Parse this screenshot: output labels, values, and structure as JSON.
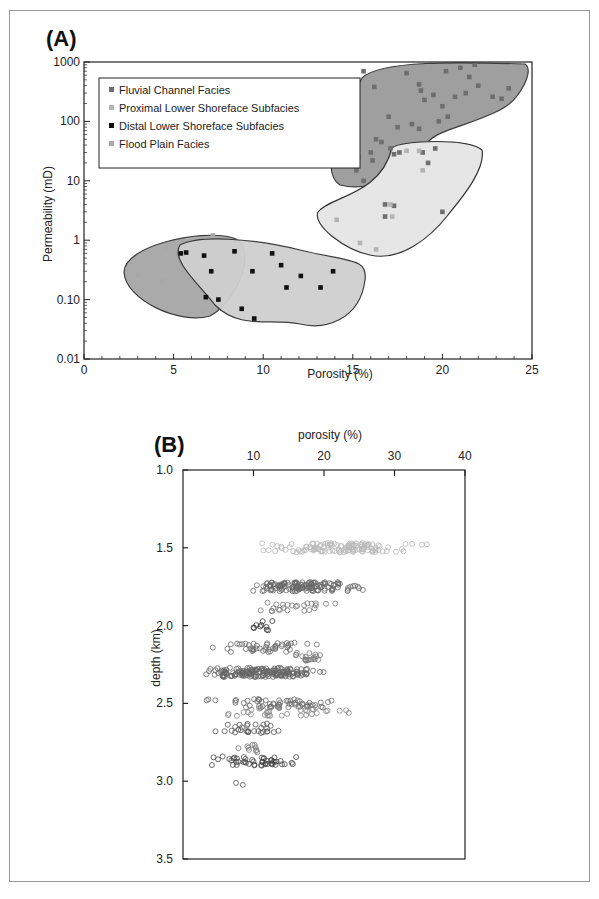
{
  "figure": {
    "panel_a_label": "(A)",
    "panel_b_label": "(B)"
  },
  "chart_data": [
    {
      "type": "scatter",
      "panel": "(A)",
      "title": "",
      "xlabel": "Porosity  (%)",
      "ylabel": "Permeability  (mD)",
      "xlim": [
        0,
        25
      ],
      "ylim": [
        0.01,
        1000
      ],
      "yscale": "log",
      "x_ticks": [
        "0",
        "5",
        "10",
        "15",
        "20",
        "25"
      ],
      "y_ticks": [
        "0.01",
        "0.10",
        "1",
        "10",
        "100",
        "1000"
      ],
      "grid": false,
      "legend_position": "upper-left",
      "legend": [
        {
          "name": "Fluvial Channel Facies",
          "color": "#6e6e6e"
        },
        {
          "name": "Proximal Lower Shoreface  Subfacies",
          "color": "#b4b4b4"
        },
        {
          "name": "Distal Lower Shoreface  Subfacies",
          "color": "#111111"
        },
        {
          "name": "Flood  Plain  Facies",
          "color": "#a8a8a8"
        }
      ],
      "series": [
        {
          "name": "Fluvial Channel Facies",
          "points": [
            [
              15.6,
              700
            ],
            [
              16.2,
              380
            ],
            [
              18.0,
              650
            ],
            [
              18.7,
              420
            ],
            [
              18.8,
              330
            ],
            [
              19.0,
              230
            ],
            [
              19.5,
              280
            ],
            [
              20.0,
              180
            ],
            [
              20.2,
              700
            ],
            [
              20.7,
              260
            ],
            [
              20.3,
              120
            ],
            [
              19.8,
              100
            ],
            [
              21.3,
              300
            ],
            [
              21.0,
              800
            ],
            [
              21.5,
              560
            ],
            [
              22.0,
              400
            ],
            [
              22.8,
              260
            ],
            [
              23.3,
              240
            ],
            [
              23.7,
              360
            ],
            [
              21.8,
              900
            ],
            [
              17.0,
              120
            ],
            [
              17.5,
              80
            ],
            [
              18.3,
              90
            ],
            [
              18.7,
              75
            ],
            [
              16.3,
              50
            ],
            [
              16.6,
              45
            ],
            [
              17.1,
              35
            ],
            [
              17.3,
              28
            ],
            [
              17.6,
              30
            ],
            [
              18.9,
              30
            ],
            [
              19.6,
              35
            ],
            [
              19.2,
              20
            ],
            [
              14.6,
              45
            ],
            [
              14.8,
              45
            ],
            [
              15.3,
              25
            ],
            [
              15.2,
              15
            ],
            [
              16.0,
              30
            ],
            [
              16.1,
              22
            ],
            [
              15.6,
              10
            ],
            [
              16.8,
              4
            ],
            [
              16.8,
              2.5
            ],
            [
              20.0,
              3
            ],
            [
              17.3,
              3.8
            ]
          ]
        },
        {
          "name": "Proximal Lower Shoreface  Subfacies",
          "points": [
            [
              18.0,
              32
            ],
            [
              18.7,
              32
            ],
            [
              18.9,
              15
            ],
            [
              17.1,
              4
            ],
            [
              17.2,
              2.5
            ],
            [
              14.1,
              2.2
            ],
            [
              15.4,
              0.9
            ],
            [
              16.3,
              0.7
            ]
          ]
        },
        {
          "name": "Distal Lower Shoreface  Subfacies",
          "points": [
            [
              5.4,
              0.6
            ],
            [
              5.7,
              0.62
            ],
            [
              6.7,
              0.55
            ],
            [
              7.1,
              0.3
            ],
            [
              8.4,
              0.65
            ],
            [
              9.4,
              0.3
            ],
            [
              10.5,
              0.6
            ],
            [
              11.0,
              0.38
            ],
            [
              12.1,
              0.25
            ],
            [
              13.9,
              0.3
            ],
            [
              11.3,
              0.16
            ],
            [
              13.2,
              0.16
            ],
            [
              6.8,
              0.11
            ],
            [
              7.5,
              0.1
            ],
            [
              8.8,
              0.07
            ],
            [
              9.5,
              0.048
            ]
          ]
        },
        {
          "name": "Flood  Plain  Facies",
          "points": [
            [
              3.0,
              0.26
            ],
            [
              4.6,
              0.76
            ],
            [
              4.4,
              0.21
            ],
            [
              6.6,
              0.06
            ],
            [
              7.2,
              1.2
            ]
          ]
        }
      ],
      "regions": [
        {
          "name": "Fluvial Channel Facies envelope",
          "fill": "#9a9a9a"
        },
        {
          "name": "Proximal Lower Shoreface envelope",
          "fill": "#e6e6e6"
        },
        {
          "name": "Flood Plain envelope",
          "fill": "#a6a6a6"
        },
        {
          "name": "Distal Lower Shoreface envelope",
          "fill": "#cfcfcf"
        }
      ]
    },
    {
      "type": "scatter",
      "panel": "(B)",
      "title": "",
      "xlabel": "porosity  (%)",
      "ylabel": "depth  (km)",
      "xaxis_position": "top",
      "xlim": [
        0,
        40
      ],
      "ylim": [
        3.5,
        1.0
      ],
      "y_inverted": true,
      "x_ticks": [
        "10",
        "20",
        "30",
        "40"
      ],
      "y_ticks": [
        "1.0",
        "1.5",
        "2.0",
        "2.5",
        "3.0",
        "3.5"
      ],
      "grid": false,
      "marker": "open-circle",
      "clusters": [
        {
          "depth_km": 1.5,
          "x_range": [
            8,
            37
          ],
          "count": 120,
          "color": "#b8b8b8"
        },
        {
          "depth_km": 1.75,
          "x_range": [
            7,
            27
          ],
          "count": 140,
          "color": "#6a6a6a"
        },
        {
          "depth_km": 1.88,
          "x_range": [
            9,
            23
          ],
          "count": 25,
          "color": "#7a7a7a"
        },
        {
          "depth_km": 2.0,
          "x_range": [
            8.5,
            14
          ],
          "count": 10,
          "color": "#333333"
        },
        {
          "depth_km": 2.14,
          "x_range": [
            2,
            21
          ],
          "count": 45,
          "color": "#6a6a6a"
        },
        {
          "depth_km": 2.2,
          "x_range": [
            15,
            20
          ],
          "count": 20,
          "color": "#7a7a7a"
        },
        {
          "depth_km": 2.3,
          "x_range": [
            1,
            22
          ],
          "count": 170,
          "color": "#666666"
        },
        {
          "depth_km": 2.5,
          "x_range": [
            1,
            26
          ],
          "count": 60,
          "color": "#6a6a6a"
        },
        {
          "depth_km": 2.55,
          "x_range": [
            1,
            26
          ],
          "count": 35,
          "color": "#888888"
        },
        {
          "depth_km": 2.66,
          "x_range": [
            3,
            16
          ],
          "count": 30,
          "color": "#555555"
        },
        {
          "depth_km": 2.79,
          "x_range": [
            8,
            12
          ],
          "count": 10,
          "color": "#777777"
        },
        {
          "depth_km": 2.87,
          "x_range": [
            2,
            19
          ],
          "count": 50,
          "color": "#444444"
        },
        {
          "depth_km": 3.04,
          "x_range": [
            7,
            8.5
          ],
          "count": 2,
          "color": "#555555"
        }
      ]
    }
  ]
}
